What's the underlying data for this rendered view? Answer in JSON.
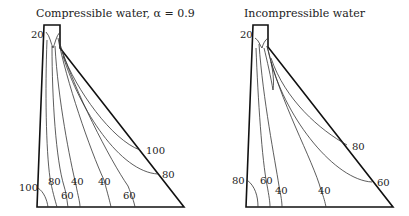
{
  "panels": [
    {
      "title": "Compressible water, α = 0.9",
      "labels": {
        "crest": "20",
        "upstream_heel": "100",
        "c80": "80",
        "c60": "60",
        "c40a": "40",
        "c40b": "40",
        "c60b": "60",
        "face100": "100",
        "face80": "80"
      }
    },
    {
      "title": "Incompressible water",
      "labels": {
        "crest": "20",
        "upstream_heel": "80",
        "c60": "60",
        "c40a": "40",
        "c40b": "40",
        "face80": "80",
        "face60": "60"
      }
    }
  ]
}
